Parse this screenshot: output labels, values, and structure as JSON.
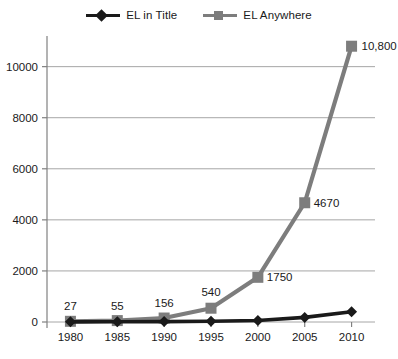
{
  "chart_data": {
    "type": "line",
    "title": "",
    "subtitle": "",
    "xlabel": "",
    "ylabel": "",
    "x": [
      1980,
      1985,
      1990,
      1995,
      2000,
      2005,
      2010
    ],
    "categories": [
      "1980",
      "1985",
      "1990",
      "1995",
      "2000",
      "2005",
      "2010"
    ],
    "xtick_labels": [
      "1980",
      "1985",
      "1990",
      "1995",
      "2000",
      "2005",
      "2010"
    ],
    "ytick_labels": [
      "0",
      "2000",
      "4000",
      "6000",
      "8000",
      "10000"
    ],
    "yticks": [
      0,
      2000,
      4000,
      6000,
      8000,
      10000
    ],
    "ylim": [
      0,
      11200
    ],
    "xlim": [
      1977.5,
      2012.5
    ],
    "grid": "horizontal",
    "legend_position": "top-center",
    "series": [
      {
        "name": "EL in Title",
        "color": "#1a1a1a",
        "marker": "diamond",
        "values": [
          5,
          8,
          15,
          30,
          60,
          180,
          400
        ],
        "data_labels": [
          "",
          "",
          "",
          "",
          "",
          "",
          ""
        ]
      },
      {
        "name": "EL Anywhere",
        "color": "#7d7d7d",
        "marker": "square",
        "values": [
          27,
          55,
          156,
          540,
          1750,
          4670,
          10800
        ],
        "data_labels": [
          "27",
          "55",
          "156",
          "540",
          "1750",
          "4670",
          "10,800"
        ]
      }
    ]
  },
  "legend": {
    "entries": [
      {
        "label": "EL in Title",
        "marker_icon": "diamond-marker-icon"
      },
      {
        "label": "EL Anywhere",
        "marker_icon": "square-marker-icon"
      }
    ]
  },
  "colors": {
    "series_black": "#1a1a1a",
    "series_gray": "#7d7d7d",
    "gridline": "#a6a6a6",
    "axis": "#808080",
    "background": "#ffffff",
    "text": "#1a1a1a"
  }
}
